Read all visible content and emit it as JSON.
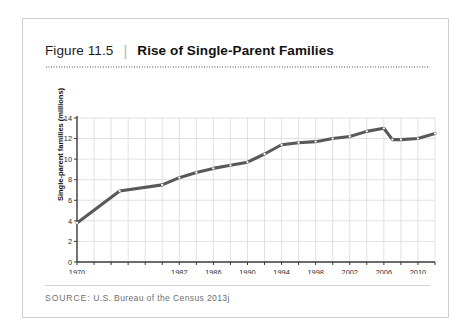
{
  "figure": {
    "number_label": "Figure 11.5",
    "separator": "|",
    "title": "Rise of Single-Parent Families",
    "source_label": "SOURCE:",
    "source_text": "U.S. Bureau of the Census 2013j"
  },
  "colors": {
    "line": "#595959",
    "marker_fill": "#ffffff",
    "grid": "#d9d9d9",
    "axis": "#3a3a3a",
    "card_border": "#cfcfcf",
    "text": "#1d1d1d",
    "source_text": "#6f6f6f"
  },
  "chart_data": {
    "type": "line",
    "title": "Rise of Single-Parent Families",
    "xlabel": "",
    "ylabel": "Single-parent families (millions)",
    "xlim": [
      1970,
      2012
    ],
    "ylim": [
      0,
      14
    ],
    "ytick_labels": [
      "0",
      "2",
      "4",
      "6",
      "8",
      "10",
      "12",
      "14"
    ],
    "yticks": [
      0,
      2,
      4,
      6,
      8,
      10,
      12,
      14
    ],
    "xtick_labels": [
      "1970",
      "1982",
      "1986",
      "1990",
      "1994",
      "1998",
      "2002",
      "2006",
      "2010"
    ],
    "xticks": [
      1970,
      1982,
      1986,
      1990,
      1994,
      1998,
      2002,
      2006,
      2010
    ],
    "grid": true,
    "legend": "none",
    "markers": "small white circles",
    "x": [
      1970,
      1975,
      1980,
      1982,
      1984,
      1986,
      1988,
      1990,
      1992,
      1994,
      1996,
      1998,
      2000,
      2002,
      2004,
      2006,
      2007,
      2008,
      2010,
      2012
    ],
    "values": [
      3.8,
      6.9,
      7.5,
      8.2,
      8.7,
      9.1,
      9.4,
      9.7,
      10.5,
      11.4,
      11.6,
      11.7,
      12.0,
      12.2,
      12.7,
      13.0,
      11.9,
      11.9,
      12.0,
      12.5
    ],
    "series": [
      {
        "name": "Single-parent families (millions)",
        "values": [
          3.8,
          6.9,
          7.5,
          8.2,
          8.7,
          9.1,
          9.4,
          9.7,
          10.5,
          11.4,
          11.6,
          11.7,
          12.0,
          12.2,
          12.7,
          13.0,
          11.9,
          11.9,
          12.0,
          12.5
        ]
      }
    ]
  }
}
